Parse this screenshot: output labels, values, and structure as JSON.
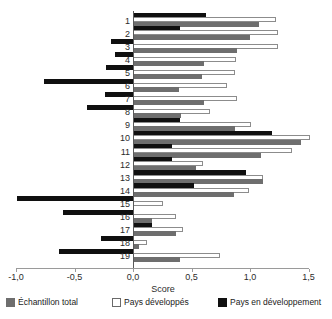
{
  "chart_data": {
    "type": "bar",
    "orientation": "horizontal",
    "title": "",
    "xlabel": "Score",
    "ylabel": "",
    "xlim": [
      -1.0,
      1.5
    ],
    "xticks": [
      -1.0,
      -0.5,
      0.0,
      0.5,
      1.0,
      1.5
    ],
    "xticklabels": [
      "-1,0",
      "-0,5",
      "0,0",
      "0,5",
      "1,0",
      "1,5"
    ],
    "grid": false,
    "legend_position": "bottom",
    "categories": [
      "1",
      "2",
      "3",
      "4",
      "5",
      "6",
      "7",
      "8",
      "9",
      "10",
      "11",
      "12",
      "13",
      "14",
      "15",
      "16",
      "17",
      "18",
      "19"
    ],
    "series": [
      {
        "name": "Pays en développement",
        "color": "#101010",
        "values": [
          0.62,
          0.4,
          -0.19,
          -0.15,
          -0.23,
          -0.76,
          -0.24,
          -0.39,
          0.4,
          1.19,
          0.33,
          0.33,
          0.97,
          0.52,
          -0.99,
          -0.6,
          0.16,
          -0.27,
          -0.63
        ]
      },
      {
        "name": "Pays développés",
        "color": "#ffffff",
        "values": [
          1.22,
          1.24,
          1.24,
          0.88,
          0.87,
          0.8,
          0.89,
          0.66,
          1.01,
          1.51,
          1.36,
          0.6,
          1.11,
          0.99,
          0.26,
          0.37,
          0.43,
          0.12,
          0.74
        ]
      },
      {
        "name": "Échantillon total",
        "color": "#6e6e6e",
        "values": [
          1.08,
          1.0,
          0.89,
          0.61,
          0.59,
          0.39,
          0.61,
          0.41,
          0.87,
          1.44,
          1.09,
          0.54,
          1.11,
          0.86,
          0.01,
          0.16,
          0.37,
          0.05,
          0.4
        ]
      }
    ]
  },
  "legend": {
    "items": [
      {
        "label": "Échantillon total",
        "swatch": "total"
      },
      {
        "label": "Pays développés",
        "swatch": "dev"
      },
      {
        "label": "Pays en développement",
        "swatch": "devg"
      }
    ]
  },
  "axis": {
    "xlabel": "Score"
  }
}
